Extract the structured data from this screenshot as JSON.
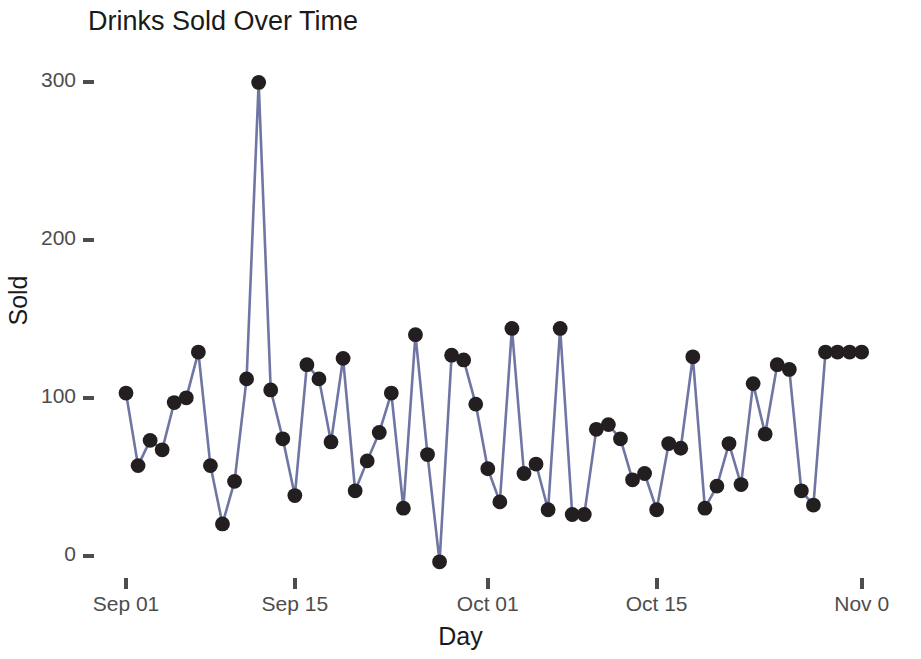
{
  "chart_data": {
    "type": "line",
    "title": "Drinks Sold Over Time",
    "xlabel": "Day",
    "ylabel": "Sold",
    "grid": false,
    "legend": false,
    "marker": "filled-circle",
    "line_color": "#6f76a3",
    "marker_color": "#231f20",
    "ylim": [
      -10,
      305
    ],
    "yticks": [
      0,
      100,
      200,
      300
    ],
    "ytick_labels": [
      "0",
      "100",
      "200",
      "300"
    ],
    "xticks": [
      "Sep 01",
      "Sep 15",
      "Oct 01",
      "Oct 15",
      "Nov 0"
    ],
    "xtick_days": [
      1,
      15,
      31,
      45,
      62
    ],
    "x": [
      "Sep 01",
      "Sep 02",
      "Sep 03",
      "Sep 04",
      "Sep 05",
      "Sep 06",
      "Sep 07",
      "Sep 08",
      "Sep 09",
      "Sep 10",
      "Sep 11",
      "Sep 12",
      "Sep 13",
      "Sep 14",
      "Sep 15",
      "Sep 16",
      "Sep 17",
      "Sep 18",
      "Sep 19",
      "Sep 20",
      "Sep 21",
      "Sep 22",
      "Sep 23",
      "Sep 24",
      "Sep 25",
      "Sep 26",
      "Sep 27",
      "Sep 28",
      "Sep 29",
      "Sep 30",
      "Oct 01",
      "Oct 02",
      "Oct 03",
      "Oct 04",
      "Oct 05",
      "Oct 06",
      "Oct 07",
      "Oct 08",
      "Oct 09",
      "Oct 10",
      "Oct 11",
      "Oct 12",
      "Oct 13",
      "Oct 14",
      "Oct 15",
      "Oct 16",
      "Oct 17",
      "Oct 18",
      "Oct 19",
      "Oct 20",
      "Oct 21",
      "Oct 22",
      "Oct 23",
      "Oct 24",
      "Oct 25",
      "Oct 26",
      "Oct 27",
      "Oct 28",
      "Oct 29",
      "Oct 30",
      "Oct 31",
      "Nov 01"
    ],
    "values": [
      103,
      57,
      73,
      67,
      97,
      100,
      129,
      57,
      20,
      47,
      112,
      300,
      105,
      74,
      38,
      121,
      112,
      72,
      125,
      41,
      60,
      78,
      103,
      30,
      140,
      64,
      -4,
      127,
      124,
      96,
      55,
      34,
      144,
      52,
      58,
      29,
      144,
      26,
      26,
      80,
      83,
      74,
      48,
      52,
      29,
      71,
      68,
      126,
      30,
      44,
      71,
      45,
      109,
      77,
      121,
      118,
      41,
      32,
      129,
      129,
      129,
      129
    ],
    "series_name": "Sold"
  },
  "plot_geometry": {
    "x0_px": 126,
    "px_per_day": 12.06,
    "y0_px": 555.5,
    "px_per_unit": 1.577
  }
}
